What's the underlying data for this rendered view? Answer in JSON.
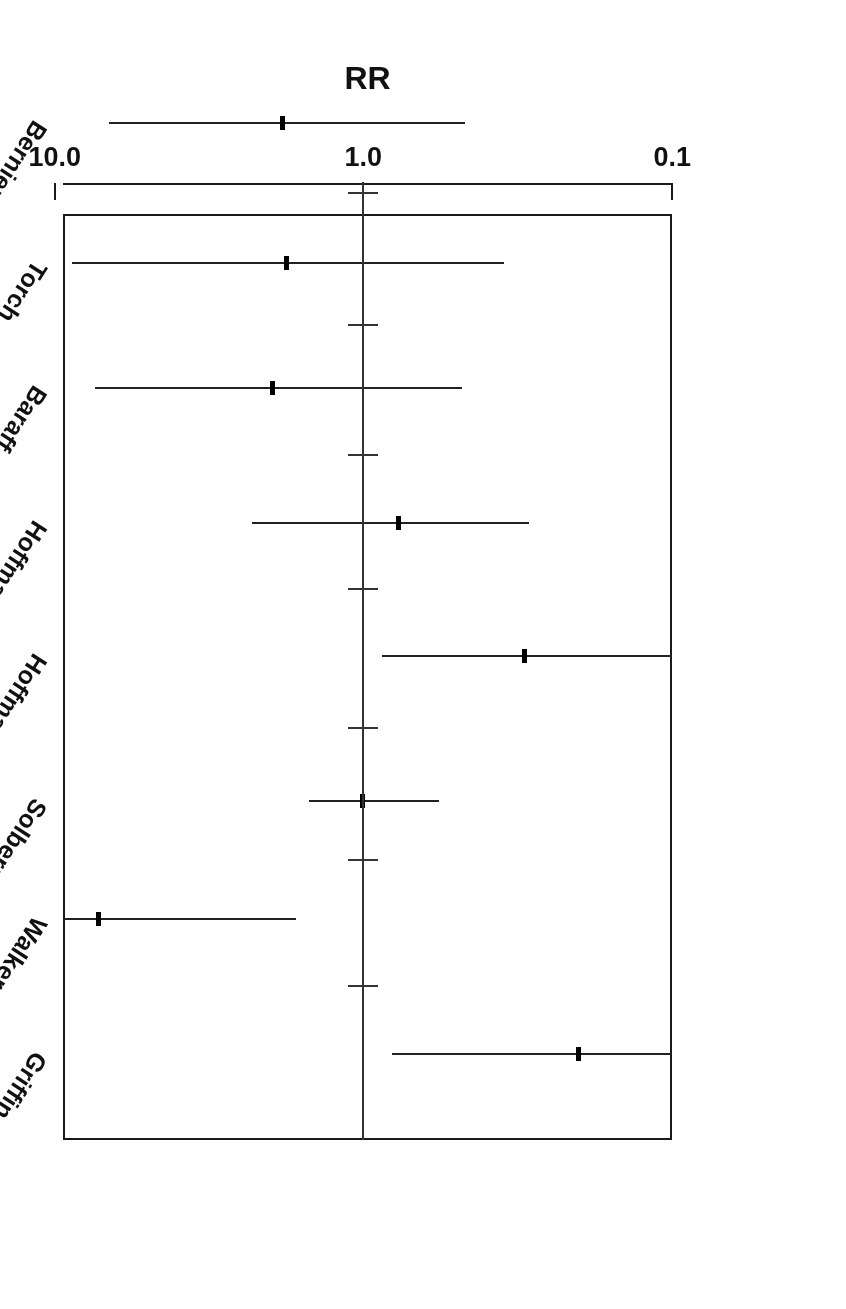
{
  "figure": {
    "orientation": "rotated-180",
    "type": "forest-plot",
    "axis_title": "RR",
    "tick_labels": [
      "10.0",
      "1.0",
      "0.1"
    ],
    "line_color": "#222222",
    "frame_color": "#1a1a1a",
    "background": "#ffffff"
  },
  "chart_data": {
    "type": "scatter",
    "subtype": "forest-plot",
    "title": "",
    "xlabel": "RR",
    "ylabel": "",
    "xscale": "log",
    "xlim": [
      0.1,
      10.0
    ],
    "xticks": [
      10.0,
      1.0,
      0.1
    ],
    "xtick_labels": [
      "10.0",
      "1.0",
      "0.1"
    ],
    "axis_direction": "decreasing-left-to-right",
    "grid": false,
    "legend": null,
    "reference_line": 1.0,
    "categories": [
      "Griffin",
      "Walker",
      "Solberg",
      "Hoffman A",
      "Hoffman B",
      "Baraff",
      "Torch",
      "Bernier"
    ],
    "values": [
      0.2,
      7.2,
      1.0,
      0.3,
      0.77,
      1.96,
      1.77,
      1.82
    ],
    "points": [
      {
        "study": "Griffin",
        "rr": 0.2,
        "ci_low": 0.1,
        "ci_high": 0.81,
        "ci_low_truncated": true,
        "ci_high_truncated": false
      },
      {
        "study": "Walker",
        "rr": 7.2,
        "ci_low": 1.66,
        "ci_high": 10.0,
        "ci_low_truncated": false,
        "ci_high_truncated": true
      },
      {
        "study": "Solberg",
        "rr": 1.0,
        "ci_low": 0.57,
        "ci_high": 1.5,
        "ci_low_truncated": false,
        "ci_high_truncated": false
      },
      {
        "study": "Hoffman A",
        "rr": 0.3,
        "ci_low": 0.1,
        "ci_high": 0.87,
        "ci_low_truncated": true,
        "ci_high_truncated": false
      },
      {
        "study": "Hoffman B",
        "rr": 0.77,
        "ci_low": 0.29,
        "ci_high": 2.3,
        "ci_low_truncated": false,
        "ci_high_truncated": false
      },
      {
        "study": "Baraff",
        "rr": 1.96,
        "ci_low": 0.48,
        "ci_high": 7.4,
        "ci_low_truncated": false,
        "ci_high_truncated": false
      },
      {
        "study": "Torch",
        "rr": 1.77,
        "ci_low": 0.35,
        "ci_high": 8.8,
        "ci_low_truncated": false,
        "ci_high_truncated": false
      },
      {
        "study": "Bernier",
        "rr": 1.82,
        "ci_low": 0.47,
        "ci_high": 6.7,
        "ci_low_truncated": false,
        "ci_high_truncated": false
      }
    ]
  }
}
